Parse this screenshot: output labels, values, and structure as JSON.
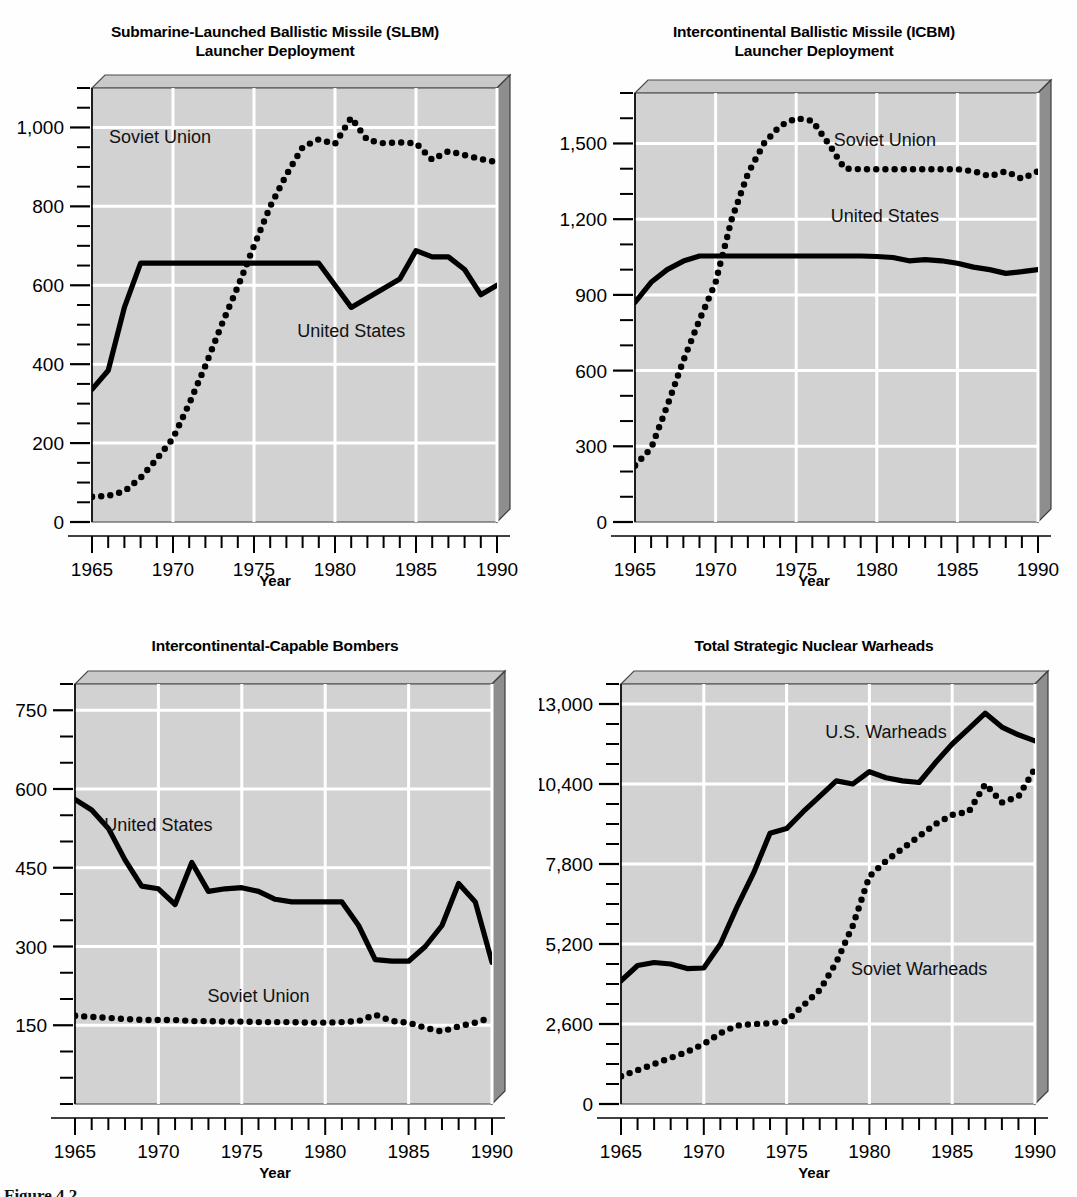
{
  "figure": {
    "caption_partial": "Figure 4.2",
    "background": "#ffffff",
    "plot_bg": "#d2d2d2",
    "grid_color": "#ffffff",
    "series_us_color": "#000000",
    "series_su_color": "#000000"
  },
  "panels": [
    {
      "id": "slbm",
      "title_line1": "Submarine-Launched Ballistic Missile (SLBM)",
      "title_line2": "Launcher Deployment",
      "xlabel": "Year"
    },
    {
      "id": "icbm",
      "title_line1": "Intercontinental Ballistic Missile (ICBM)",
      "title_line2": "Launcher Deployment",
      "xlabel": "Year"
    },
    {
      "id": "bombers",
      "title_line1": "Intercontinental-Capable Bombers",
      "title_line2": "",
      "xlabel": "Year"
    },
    {
      "id": "warheads",
      "title_line1": "Total Strategic Nuclear Warheads",
      "title_line2": "",
      "xlabel": "Year"
    }
  ],
  "chart_data": [
    {
      "id": "slbm",
      "type": "line",
      "title": "Submarine-Launched Ballistic Missile (SLBM) Launcher Deployment",
      "xlabel": "Year",
      "ylabel": "",
      "xlim": [
        1965,
        1990
      ],
      "ylim": [
        0,
        1100
      ],
      "yticks": [
        0,
        200,
        400,
        600,
        800,
        1000
      ],
      "ytick_labels": [
        "0",
        "200",
        "400",
        "600",
        "800",
        "1,000"
      ],
      "yminor_step": 50,
      "xticks": [
        1965,
        1970,
        1975,
        1980,
        1985,
        1990
      ],
      "xtick_labels": [
        "1965",
        "1970",
        "1975",
        "1980",
        "1985",
        "1990"
      ],
      "xminor_step": 1,
      "grid": true,
      "legend_position": "inline-annotations",
      "annotations": [
        {
          "text": "Soviet Union",
          "x": 1969.2,
          "y": 960
        },
        {
          "text": "United States",
          "x": 1981.0,
          "y": 470
        }
      ],
      "x": [
        1965,
        1966,
        1967,
        1968,
        1969,
        1970,
        1971,
        1972,
        1973,
        1974,
        1975,
        1976,
        1977,
        1978,
        1979,
        1980,
        1981,
        1982,
        1983,
        1984,
        1985,
        1986,
        1987,
        1988,
        1989,
        1990
      ],
      "series": [
        {
          "name": "United States",
          "style": "solid",
          "values": [
            336,
            384,
            544,
            656,
            656,
            656,
            656,
            656,
            656,
            656,
            656,
            656,
            656,
            656,
            656,
            600,
            544,
            568,
            592,
            616,
            688,
            672,
            672,
            640,
            576,
            600
          ]
        },
        {
          "name": "Soviet Union",
          "style": "dotted",
          "values": [
            64,
            66,
            78,
            112,
            160,
            212,
            300,
            396,
            500,
            596,
            700,
            800,
            880,
            950,
            970,
            958,
            1025,
            968,
            960,
            962,
            960,
            918,
            940,
            930,
            920,
            912
          ]
        }
      ]
    },
    {
      "id": "icbm",
      "type": "line",
      "title": "Intercontinental Ballistic Missile (ICBM) Launcher Deployment",
      "xlabel": "Year",
      "ylabel": "",
      "xlim": [
        1965,
        1990
      ],
      "ylim": [
        0,
        1700
      ],
      "yticks": [
        0,
        300,
        600,
        900,
        1200,
        1500
      ],
      "ytick_labels": [
        "0",
        "300",
        "600",
        "900",
        "1,200",
        "1,500"
      ],
      "yminor_step": 100,
      "xticks": [
        1965,
        1970,
        1975,
        1980,
        1985,
        1990
      ],
      "xtick_labels": [
        "1965",
        "1970",
        "1975",
        "1980",
        "1985",
        "1990"
      ],
      "xminor_step": 1,
      "grid": true,
      "legend_position": "inline-annotations",
      "annotations": [
        {
          "text": "Soviet Union",
          "x": 1980.5,
          "y": 1490
        },
        {
          "text": "United States",
          "x": 1980.5,
          "y": 1190
        }
      ],
      "x": [
        1965,
        1966,
        1967,
        1968,
        1969,
        1970,
        1971,
        1972,
        1973,
        1974,
        1975,
        1976,
        1977,
        1978,
        1979,
        1980,
        1981,
        1982,
        1983,
        1984,
        1985,
        1986,
        1987,
        1988,
        1989,
        1990
      ],
      "series": [
        {
          "name": "United States",
          "style": "solid",
          "values": [
            870,
            950,
            1000,
            1034,
            1054,
            1054,
            1054,
            1054,
            1054,
            1054,
            1054,
            1054,
            1054,
            1054,
            1054,
            1052,
            1048,
            1035,
            1040,
            1035,
            1025,
            1010,
            1000,
            985,
            992,
            1000
          ]
        },
        {
          "name": "Soviet Union",
          "style": "dotted",
          "values": [
            224,
            292,
            460,
            640,
            800,
            950,
            1200,
            1380,
            1500,
            1570,
            1600,
            1590,
            1500,
            1400,
            1398,
            1398,
            1398,
            1398,
            1398,
            1398,
            1398,
            1390,
            1370,
            1390,
            1360,
            1390
          ]
        }
      ]
    },
    {
      "id": "bombers",
      "type": "line",
      "title": "Intercontinental-Capable Bombers",
      "xlabel": "Year",
      "ylabel": "",
      "xlim": [
        1965,
        1990
      ],
      "ylim": [
        0,
        800
      ],
      "yticks": [
        150,
        300,
        450,
        600,
        750
      ],
      "ytick_labels": [
        "150",
        "300",
        "450",
        "600",
        "750"
      ],
      "yminor_step": 50,
      "xticks": [
        1965,
        1970,
        1975,
        1980,
        1985,
        1990
      ],
      "xtick_labels": [
        "1965",
        "1970",
        "1975",
        "1980",
        "1985",
        "1990"
      ],
      "xminor_step": 1,
      "grid": true,
      "legend_position": "inline-annotations",
      "annotations": [
        {
          "text": "United States",
          "x": 1970.0,
          "y": 520
        },
        {
          "text": "Soviet Union",
          "x": 1976.0,
          "y": 195
        }
      ],
      "x": [
        1965,
        1966,
        1967,
        1968,
        1969,
        1970,
        1971,
        1972,
        1973,
        1974,
        1975,
        1976,
        1977,
        1978,
        1979,
        1980,
        1981,
        1982,
        1983,
        1984,
        1985,
        1986,
        1987,
        1988,
        1989,
        1990
      ],
      "series": [
        {
          "name": "United States",
          "style": "solid",
          "values": [
            580,
            560,
            525,
            465,
            415,
            410,
            380,
            460,
            405,
            410,
            412,
            405,
            390,
            385,
            385,
            385,
            385,
            340,
            275,
            272,
            272,
            300,
            340,
            420,
            385,
            270
          ]
        },
        {
          "name": "Soviet Union",
          "style": "dotted",
          "values": [
            168,
            166,
            164,
            162,
            160,
            160,
            160,
            158,
            158,
            157,
            157,
            156,
            156,
            156,
            155,
            155,
            156,
            158,
            170,
            158,
            155,
            145,
            138,
            148,
            155,
            165
          ]
        }
      ]
    },
    {
      "id": "warheads",
      "type": "line",
      "title": "Total Strategic Nuclear Warheads",
      "xlabel": "Year",
      "ylabel": "",
      "xlim": [
        1965,
        1990
      ],
      "ylim": [
        0,
        13650
      ],
      "yticks": [
        0,
        2600,
        5200,
        7800,
        10400,
        13000
      ],
      "ytick_labels": [
        "0",
        "2,600",
        "5,200",
        "7,800",
        "10,400",
        "13,000"
      ],
      "yminor_step": 650,
      "xticks": [
        1965,
        1970,
        1975,
        1980,
        1985,
        1990
      ],
      "xtick_labels": [
        "1965",
        "1970",
        "1975",
        "1980",
        "1985",
        "1990"
      ],
      "xminor_step": 1,
      "grid": true,
      "legend_position": "inline-annotations",
      "annotations": [
        {
          "text": "U.S. Warheads",
          "x": 1981.0,
          "y": 11900
        },
        {
          "text": "Soviet Warheads",
          "x": 1983.0,
          "y": 4200
        }
      ],
      "x": [
        1965,
        1966,
        1967,
        1968,
        1969,
        1970,
        1971,
        1972,
        1973,
        1974,
        1975,
        1976,
        1977,
        1978,
        1979,
        1980,
        1981,
        1982,
        1983,
        1984,
        1985,
        1986,
        1987,
        1988,
        1989,
        1990
      ],
      "series": [
        {
          "name": "U.S. Warheads",
          "style": "solid",
          "values": [
            4000,
            4500,
            4600,
            4550,
            4400,
            4420,
            5200,
            6400,
            7500,
            8800,
            8950,
            9500,
            10000,
            10500,
            10400,
            10800,
            10600,
            10500,
            10450,
            11100,
            11700,
            12200,
            12700,
            12250,
            12000,
            11800
          ]
        },
        {
          "name": "Soviet Warheads",
          "style": "dotted",
          "values": [
            900,
            1100,
            1300,
            1500,
            1700,
            1950,
            2300,
            2550,
            2600,
            2620,
            2700,
            3200,
            3700,
            4600,
            5800,
            7400,
            7900,
            8300,
            8700,
            9100,
            9400,
            9500,
            10400,
            9800,
            10000,
            10900
          ]
        }
      ]
    }
  ]
}
